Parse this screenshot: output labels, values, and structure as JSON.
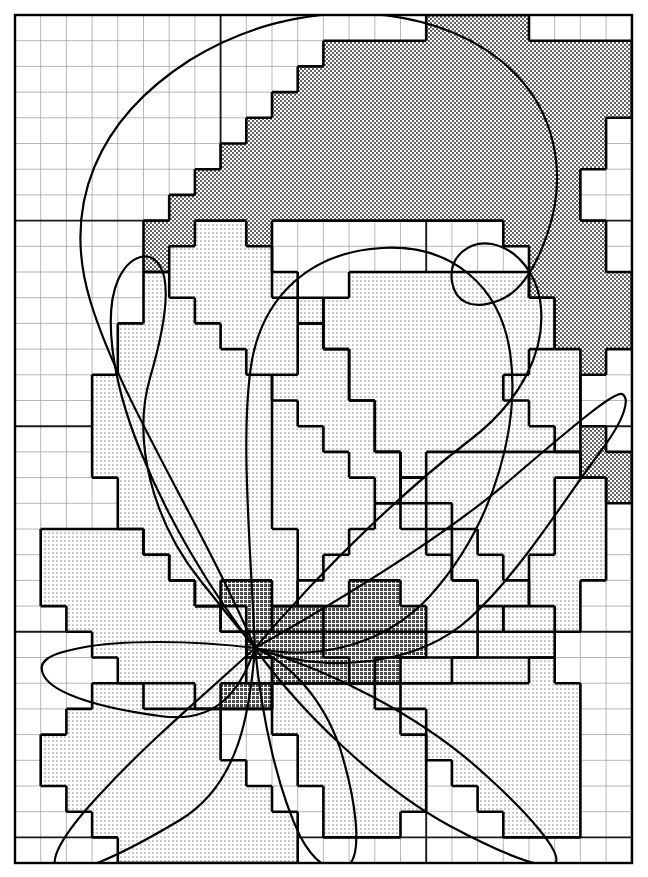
{
  "figure": {
    "kind": "rasterization-overlay-illustration",
    "canvas": {
      "width": 648,
      "height": 877,
      "background": "#ffffff"
    }
  },
  "grid": {
    "origin_x": 15,
    "origin_y": 15,
    "cell_size": 25.7,
    "cols": 24,
    "rows": 33,
    "minor_line_color": "#9a9a9a",
    "minor_line_width": 0.7,
    "major_line_color": "#1a1a1a",
    "major_line_width": 1.9,
    "major_every": 8,
    "border_color": "#000000",
    "border_width": 2.4
  },
  "palette": {
    "ink": "#111111",
    "outline_curve": "#000000",
    "raster_outline": "#000000",
    "fill_light": "#d8d8d8",
    "fill_mid": "#bdbdbd",
    "fill_dark": "#8e8e8e",
    "fill_darkest": "#6f6f6f",
    "paper": "#ffffff"
  },
  "tones": {
    "light_label": "single petal (light stipple)",
    "dark_label": "back petal (dense stipple)",
    "overlap_label": "overlapping petals (darkest)"
  },
  "strokes": {
    "curve_width": 2.2,
    "raster_width": 2.6
  },
  "center": {
    "x": 255,
    "y": 648,
    "label": "flower-center"
  },
  "petals": [
    {
      "id": "petal-back-top",
      "name": "upper back petal",
      "tone": "dark",
      "curve": "M 255 648 C 200 520 120 400 90 300 C 62 206 96 120 190 60 C 300 -8 430 4 500 60 C 560 108 566 178 548 232 C 536 268 520 292 500 300 C 470 312 455 300 452 282 C 448 256 470 240 492 244 C 520 250 536 276 540 300 C 548 350 520 402 470 440 C 410 486 330 560 255 648 Z",
      "raster": "M 478 15 L 478 41 L 555 41 L 555 15 L 658 15 L 658 41 L 400 41 L 400 67 L 349 67 L 349 92 L 297 92 L 297 118 L 272 118 L 272 144 L 246 144 L 246 170 L 220 170 L 220 196 L 169 196 L 169 221 L 143 221 L 143 247 L 169 247 L 169 273 L 220 273 L 220 298 L 246 298 L 246 324 L 272 324 L 272 350 L 323 350 L 323 376 L 375 376 L 375 401 L 400 401 L 400 427 L 452 427 L 452 453 L 478 453 L 478 478 L 529 478 L 529 504 L 581 504 L 581 530 L 606 530 L 606 581 L 632 581 L 632 530 L 606 530 L 606 479 L 581 479 L 581 427 L 555 427 L 555 376 L 581 376 L 581 324 L 606 324 L 606 247 L 581 247 L 581 170 L 555 170 L 555 118 L 529 118 L 529 67 L 504 67 L 504 41 Z"
    },
    {
      "id": "petal-top-center",
      "name": "upper central petal",
      "tone": "light",
      "curve": "M 255 648 C 250 540 240 430 252 360 C 264 296 310 252 382 248 C 452 244 500 286 510 352 C 520 420 498 520 430 596 C 380 650 310 660 255 648 Z"
    },
    {
      "id": "petal-left-upper",
      "name": "upper-left petal",
      "tone": "light",
      "curve": "M 255 648 C 210 590 168 520 140 450 C 110 376 104 312 118 280 C 130 254 150 250 160 266 C 172 286 164 330 150 378 C 132 440 152 520 200 580 C 222 608 240 630 255 648 Z"
    },
    {
      "id": "petal-right-upper",
      "name": "upper-right petal",
      "tone": "light",
      "curve": "M 255 648 C 340 600 440 540 510 480 C 580 420 614 392 622 394 C 630 398 626 418 600 452 C 560 506 520 572 470 618 C 420 664 330 676 255 648 Z"
    },
    {
      "id": "petal-left-lower",
      "name": "lower-left petal",
      "tone": "light",
      "curve": "M 255 648 C 190 640 120 640 80 648 C 48 654 36 662 44 676 C 54 694 100 708 160 716 C 216 724 240 692 255 648 Z"
    },
    {
      "id": "petal-bottom-left",
      "name": "lower-left sweeping petal",
      "tone": "light",
      "curve": "M 255 648 C 210 690 150 740 104 790 C 60 836 48 862 58 870 C 70 878 120 856 180 820 C 240 784 250 710 255 648 Z"
    },
    {
      "id": "petal-bottom-center",
      "name": "lower central petal",
      "tone": "light",
      "curve": "M 255 648 C 262 720 278 790 300 836 C 318 870 340 876 350 864 C 362 850 356 800 340 748 C 322 696 288 662 255 648 Z"
    },
    {
      "id": "petal-bottom-right",
      "name": "lower-right petal",
      "tone": "light",
      "curve": "M 255 648 C 330 670 420 716 480 770 C 534 818 560 852 556 862 C 550 872 510 858 450 826 C 380 788 300 712 255 648 Z"
    }
  ],
  "annotations": [],
  "labels": {
    "figure_caption": "",
    "axis_labels": []
  }
}
